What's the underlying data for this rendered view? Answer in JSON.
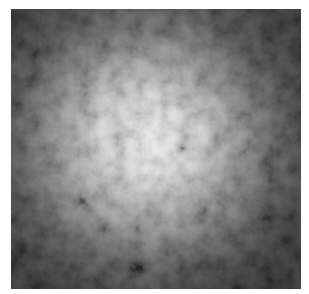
{
  "image": {
    "description": "Grayscale cloud noise texture with bright diffuse center fading to dark edges",
    "colors": {
      "background": "#ffffff",
      "edge": "#141414",
      "center": "#f2f2f2"
    }
  }
}
